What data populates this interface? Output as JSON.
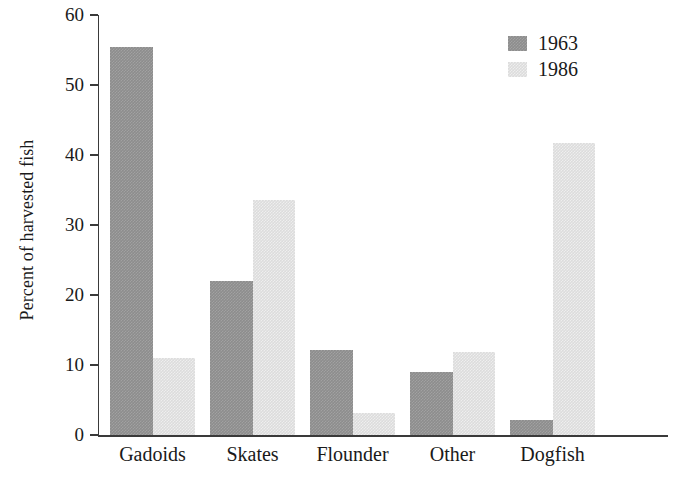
{
  "chart_data": {
    "type": "bar",
    "title": "",
    "xlabel": "",
    "ylabel": "Percent of harvested fish",
    "ylim": [
      0,
      60
    ],
    "yticks": [
      0,
      10,
      20,
      30,
      40,
      50,
      60
    ],
    "grid": false,
    "legend_position": "top-right",
    "categories": [
      "Gadoids",
      "Skates",
      "Flounder",
      "Other",
      "Dogfish"
    ],
    "series": [
      {
        "name": "1963",
        "color": "#8d8d8d",
        "values": [
          55.5,
          22.0,
          12.2,
          9.0,
          2.2
        ]
      },
      {
        "name": "1986",
        "color": "#dcdcdc",
        "values": [
          11.0,
          33.6,
          3.1,
          11.9,
          41.7
        ]
      }
    ]
  },
  "axis": {
    "y_title": "Percent of harvested fish",
    "y_tick_labels": [
      "60",
      "50",
      "40",
      "30",
      "20",
      "10",
      "0"
    ]
  },
  "legend": {
    "entries": [
      {
        "label": "1963",
        "swatch": "dark-gray-swatch"
      },
      {
        "label": "1986",
        "swatch": "light-gray-swatch"
      }
    ]
  }
}
